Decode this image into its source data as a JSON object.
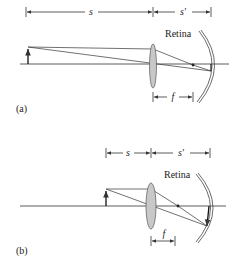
{
  "panels": [
    {
      "id": "a",
      "label": "(a)",
      "object_distance_label": "s",
      "image_distance_label": "s′",
      "focal_length_label": "f",
      "retina_label": "Retina"
    },
    {
      "id": "b",
      "label": "(b)",
      "object_distance_label": "s",
      "image_distance_label": "s′",
      "focal_length_label": "f",
      "retina_label": "Retina"
    }
  ],
  "colors": {
    "line": "#333333",
    "lens_fill": "#c8c8c8",
    "lens_stroke": "#555555",
    "background": "#ffffff"
  }
}
